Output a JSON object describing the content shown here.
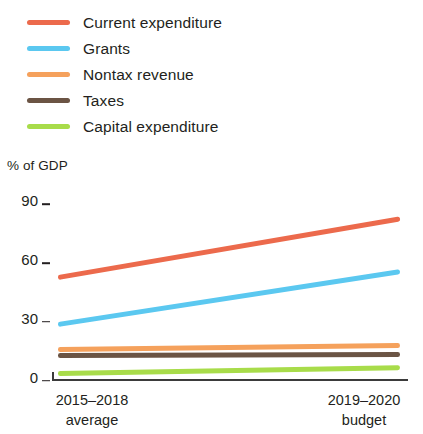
{
  "chart_data": {
    "type": "line",
    "title": "",
    "subtitle": "",
    "ylabel": "% of GDP",
    "xlabel": "",
    "categories": [
      "2015–2018 average",
      "2019–2020 budget"
    ],
    "category_lines": [
      {
        "line1": "2015–2018",
        "line2": "average"
      },
      {
        "line1": "2019–2020",
        "line2": "budget"
      }
    ],
    "ylim": [
      0,
      90
    ],
    "yticks": [
      0,
      30,
      60,
      90
    ],
    "ytick_labels": [
      "0",
      "30",
      "60",
      "90"
    ],
    "grid": false,
    "legend_position": "top-left",
    "series": [
      {
        "name": "Current expenditure",
        "color": "#EC6A4C",
        "values": [
          52,
          82
        ]
      },
      {
        "name": "Grants",
        "color": "#5BC8F0",
        "values": [
          28,
          55
        ]
      },
      {
        "name": "Nontax revenue",
        "color": "#F5A15C",
        "values": [
          15,
          17
        ]
      },
      {
        "name": "Taxes",
        "color": "#6B5444",
        "values": [
          12,
          12.5
        ]
      },
      {
        "name": "Capital expenditure",
        "color": "#A8DC4A",
        "values": [
          3,
          6
        ]
      }
    ]
  },
  "legend": {
    "items": [
      {
        "label": "Current expenditure",
        "color": "#EC6A4C"
      },
      {
        "label": "Grants",
        "color": "#5BC8F0"
      },
      {
        "label": "Nontax revenue",
        "color": "#F5A15C"
      },
      {
        "label": "Taxes",
        "color": "#6B5444"
      },
      {
        "label": "Capital expenditure",
        "color": "#A8DC4A"
      }
    ]
  },
  "axes": {
    "y_title": "% of GDP"
  }
}
